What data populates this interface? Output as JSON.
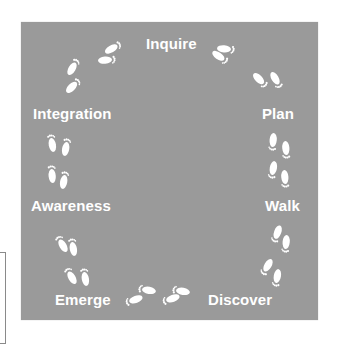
{
  "diagram": {
    "type": "cycle",
    "background_color": "#9a9a9a",
    "text_color": "#ffffff",
    "stages": [
      {
        "label": "Inquire"
      },
      {
        "label": "Plan"
      },
      {
        "label": "Walk"
      },
      {
        "label": "Discover"
      },
      {
        "label": "Emerge"
      },
      {
        "label": "Awareness"
      },
      {
        "label": "Integration"
      }
    ],
    "connector_icon": "footprints-icon"
  }
}
